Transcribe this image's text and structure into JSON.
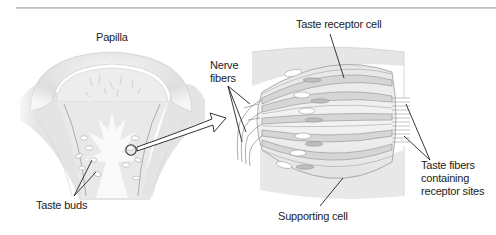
{
  "figure": {
    "type": "anatomical-diagram",
    "panels": [
      {
        "id": "papilla",
        "title": "Papilla"
      },
      {
        "id": "taste-bud-detail",
        "title": ""
      }
    ]
  },
  "labels": {
    "papilla": "Papilla",
    "nerve_fibers_line1": "Nerve",
    "nerve_fibers_line2": "fibers",
    "taste_receptor_cell": "Taste receptor cell",
    "taste_fibers_line1": "Taste fibers",
    "taste_fibers_line2": "containing",
    "taste_fibers_line3": "receptor sites",
    "taste_buds": "Taste buds",
    "supporting_cell": "Supporting cell"
  },
  "colors": {
    "rule": "#c4c4c4",
    "tissue_light": "#f2f2f2",
    "tissue_mid": "#dcdcdc",
    "tissue_dark": "#c9c9c9",
    "receptor_cell": "#d2d2d2",
    "outline": "#8a8a8a",
    "leader_line": "#333333",
    "text": "#222222"
  }
}
